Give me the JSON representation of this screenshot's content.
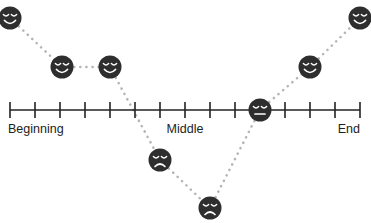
{
  "diagram": {
    "type": "emotional-journey-map",
    "timeline": {
      "y": 110,
      "x_start": 10,
      "x_end": 360,
      "tick_count": 15,
      "labels": [
        {
          "text": "Beginning",
          "x": 8,
          "align": "left"
        },
        {
          "text": "Middle",
          "x": 185,
          "align": "center"
        },
        {
          "text": "End",
          "x": 360,
          "align": "right"
        }
      ]
    },
    "points": [
      {
        "x": 10,
        "y": 18,
        "mood": "happy"
      },
      {
        "x": 62,
        "y": 67,
        "mood": "happy"
      },
      {
        "x": 110,
        "y": 67,
        "mood": "happy"
      },
      {
        "x": 160,
        "y": 160,
        "mood": "sad"
      },
      {
        "x": 210,
        "y": 208,
        "mood": "sad"
      },
      {
        "x": 260,
        "y": 110,
        "mood": "neutral"
      },
      {
        "x": 310,
        "y": 67,
        "mood": "happy"
      },
      {
        "x": 360,
        "y": 18,
        "mood": "happy"
      }
    ],
    "colors": {
      "face": "#2e2e2e",
      "feature": "#ffffff",
      "line": "#222222",
      "connector": "#b5b5b5"
    }
  }
}
